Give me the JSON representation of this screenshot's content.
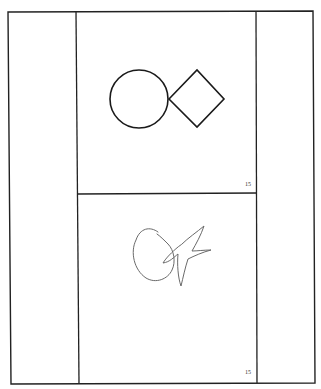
{
  "document": {
    "panels": [
      {
        "name": "reference-drawing",
        "description": "circle and diamond touching",
        "page_number": "15"
      },
      {
        "name": "copied-drawing",
        "description": "hand-drawn copy of circle and star-like shape",
        "page_number": "15"
      }
    ],
    "colors": {
      "line": "#1a1a1a",
      "sketch": "#6a6a6a",
      "background": "#ffffff"
    }
  }
}
